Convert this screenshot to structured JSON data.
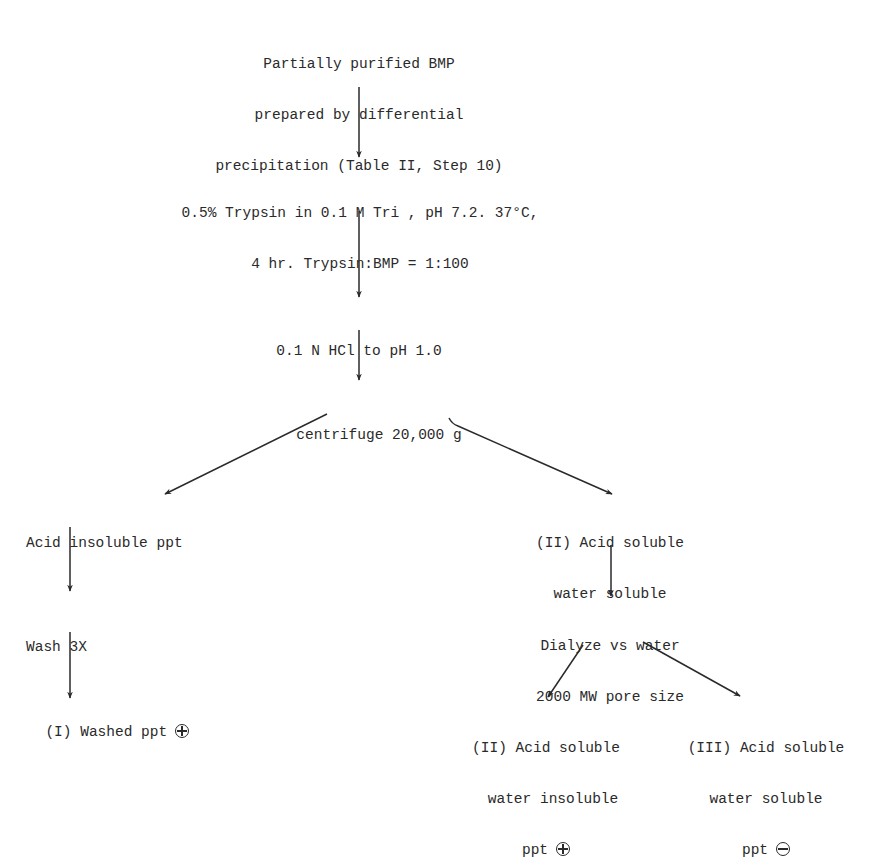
{
  "diagram": {
    "type": "flowchart",
    "nodes": {
      "start": {
        "lines": [
          "Partially purified BMP",
          "prepared by differential",
          "precipitation (Table II, Step 10)"
        ]
      },
      "trypsin": {
        "lines": [
          "0.5% Trypsin in 0.1 M Tri , pH 7.2. 37°C,",
          "4 hr. Trypsin:BMP = 1:100"
        ]
      },
      "hcl": {
        "lines": [
          "0.1 N HCl to pH 1.0"
        ]
      },
      "centrifuge": {
        "lines": [
          "centrifuge 20,000 g"
        ]
      },
      "acid_insoluble": {
        "lines": [
          "Acid insoluble ppt"
        ]
      },
      "acid_soluble_water_soluble": {
        "lines": [
          "(II) Acid soluble",
          "water soluble"
        ]
      },
      "wash": {
        "lines": [
          "Wash 3X"
        ]
      },
      "dialyze": {
        "lines": [
          "Dialyze vs water",
          "2000 MW pore size"
        ]
      },
      "washed_ppt": {
        "lines": [
          "(I) Washed ppt"
        ],
        "result": "positive",
        "symbol": "⊕"
      },
      "water_insoluble_ppt": {
        "lines": [
          "(II) Acid soluble",
          "water insoluble",
          "ppt"
        ],
        "result": "positive",
        "symbol": "⊕"
      },
      "water_soluble_ppt": {
        "lines": [
          "(III) Acid soluble",
          "water soluble",
          "ppt"
        ],
        "result": "negative",
        "symbol": "⊖"
      }
    },
    "edges": [
      [
        "start",
        "trypsin"
      ],
      [
        "trypsin",
        "hcl"
      ],
      [
        "hcl",
        "centrifuge"
      ],
      [
        "centrifuge",
        "acid_insoluble"
      ],
      [
        "centrifuge",
        "acid_soluble_water_soluble"
      ],
      [
        "acid_insoluble",
        "wash"
      ],
      [
        "wash",
        "washed_ppt"
      ],
      [
        "acid_soluble_water_soluble",
        "dialyze"
      ],
      [
        "dialyze",
        "water_insoluble_ppt"
      ],
      [
        "dialyze",
        "water_soluble_ppt"
      ]
    ]
  }
}
